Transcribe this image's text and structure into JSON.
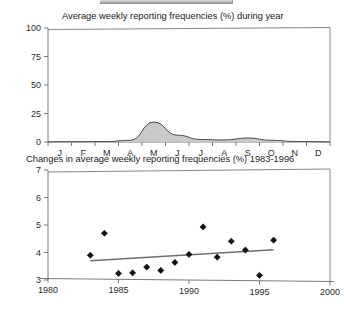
{
  "page": {
    "top_strip_label": "",
    "background_color": "#ffffff"
  },
  "charts": {
    "frequencies": {
      "title": "Average weekly reporting frequencies (%) during year",
      "y_ticks": [
        "100",
        "75",
        "50",
        "25",
        "0"
      ],
      "x_ticks": [
        "J",
        "F",
        "M",
        "A",
        "M",
        "J",
        "J",
        "A",
        "S",
        "O",
        "N",
        "D"
      ]
    },
    "changes": {
      "title": "Changes in average weekly reporting frequencies (%) 1983-1996",
      "y_ticks": [
        "7",
        "6",
        "5",
        "4",
        "3"
      ],
      "x_ticks": [
        "1980",
        "1985",
        "1990",
        "1995",
        "2000"
      ]
    }
  },
  "chart_data": [
    {
      "type": "area",
      "title": "Average weekly reporting frequencies (%) during year",
      "xlabel": "",
      "ylabel": "",
      "categories": [
        "J",
        "F",
        "M",
        "A",
        "M",
        "J",
        "J",
        "A",
        "S",
        "O",
        "N",
        "D"
      ],
      "x": [
        0.5,
        1.5,
        2.5,
        3.5,
        4.5,
        5.5,
        6.5,
        7.5,
        8.5,
        9.5,
        10.5,
        11.5
      ],
      "values": [
        0.3,
        0.3,
        0.4,
        1.5,
        17.5,
        6.0,
        2.2,
        1.8,
        3.5,
        1.5,
        0.5,
        0.3
      ],
      "ylim": [
        0,
        100
      ],
      "y_ticks": [
        0,
        25,
        50,
        75,
        100
      ],
      "xlim": [
        0,
        12
      ],
      "grid": false,
      "legend": "none",
      "fill_color": "#c9c9c9",
      "line_color": "#4a4a4a"
    },
    {
      "type": "scatter",
      "title": "Changes in average weekly reporting frequencies (%) 1983-1996",
      "xlabel": "",
      "ylabel": "",
      "x": [
        1983,
        1984,
        1985,
        1986,
        1987,
        1988,
        1989,
        1990,
        1991,
        1992,
        1993,
        1994,
        1995,
        1996
      ],
      "values": [
        3.9,
        4.7,
        3.24,
        3.26,
        3.47,
        3.35,
        3.64,
        3.93,
        4.93,
        3.83,
        4.41,
        4.09,
        3.17,
        4.45
      ],
      "xlim": [
        1980,
        2000
      ],
      "ylim": [
        3,
        7
      ],
      "x_ticks": [
        1980,
        1985,
        1990,
        1995,
        2000
      ],
      "y_ticks": [
        3,
        4,
        5,
        6,
        7
      ],
      "grid": false,
      "legend": "none",
      "marker": "diamond",
      "marker_color": "#111111",
      "trendline": {
        "x_start": 1983,
        "x_end": 1996,
        "y_start": 3.7,
        "y_end": 4.1,
        "color": "#6e6e6e"
      }
    }
  ]
}
